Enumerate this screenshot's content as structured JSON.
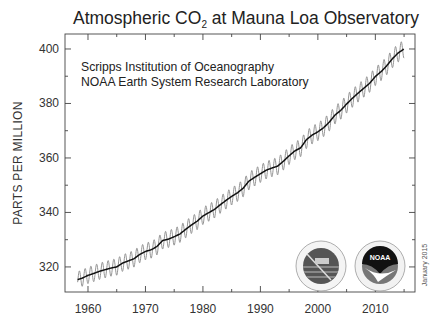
{
  "chart_data": {
    "type": "line",
    "title_main": "Atmospheric CO",
    "title_sub": "2",
    "title_rest": " at Mauna Loa Observatory",
    "title": "Atmospheric CO2 at Mauna Loa Observatory",
    "xlabel": "",
    "ylabel": "PARTS PER MILLION",
    "xlim": [
      1956,
      2016.9
    ],
    "ylim": [
      310.8,
      405.5
    ],
    "x_ticks": [
      1960,
      1970,
      1980,
      1990,
      2000,
      2010
    ],
    "x_tick_labels": [
      "1960",
      "1970",
      "1980",
      "1990",
      "2000",
      "2010"
    ],
    "x_minor_ticks": [
      1965,
      1975,
      1985,
      1995,
      2005,
      2015
    ],
    "y_ticks": [
      320,
      340,
      360,
      380,
      400
    ],
    "y_tick_labels": [
      "320",
      "340",
      "360",
      "380",
      "400"
    ],
    "y_minor_ticks": [
      330,
      350,
      370,
      390
    ],
    "grid": false,
    "annotations": [
      "Scripps Institution of Oceanography",
      "NOAA Earth System Research Laboratory"
    ],
    "date_stamp": "January 2015",
    "seasonal_amplitude_ppm": 3.0,
    "series": [
      {
        "name": "Monthly mean (seasonal cycle)",
        "color": "#888888",
        "style": "thin oscillating line"
      },
      {
        "name": "Seasonally adjusted trend",
        "color": "#111111",
        "x": [
          1958,
          1959,
          1960,
          1961,
          1962,
          1963,
          1964,
          1965,
          1966,
          1967,
          1968,
          1969,
          1970,
          1971,
          1972,
          1973,
          1974,
          1975,
          1976,
          1977,
          1978,
          1979,
          1980,
          1981,
          1982,
          1983,
          1984,
          1985,
          1986,
          1987,
          1988,
          1989,
          1990,
          1991,
          1992,
          1993,
          1994,
          1995,
          1996,
          1997,
          1998,
          1999,
          2000,
          2001,
          2002,
          2003,
          2004,
          2005,
          2006,
          2007,
          2008,
          2009,
          2010,
          2011,
          2012,
          2013,
          2014,
          2015
        ],
        "values": [
          315.2,
          315.9,
          316.9,
          317.6,
          318.4,
          319.0,
          319.6,
          320.0,
          321.4,
          322.2,
          323.0,
          324.6,
          325.7,
          326.3,
          327.5,
          329.7,
          330.2,
          331.1,
          332.1,
          333.8,
          335.4,
          336.8,
          338.7,
          339.9,
          341.1,
          342.8,
          344.4,
          345.9,
          347.2,
          348.9,
          351.5,
          352.9,
          354.2,
          355.5,
          356.3,
          357.0,
          358.8,
          360.8,
          362.6,
          363.7,
          366.7,
          368.4,
          369.6,
          371.1,
          373.2,
          375.8,
          377.5,
          379.8,
          381.9,
          383.8,
          385.6,
          387.4,
          389.9,
          391.7,
          393.9,
          396.5,
          398.6,
          400.0
        ]
      }
    ],
    "logos": [
      {
        "name": "Scripps Institution of Oceanography seal"
      },
      {
        "name": "NOAA logo",
        "text": "NOAA"
      }
    ]
  }
}
